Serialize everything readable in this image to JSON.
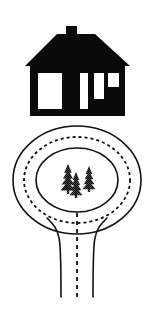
{
  "image": {
    "title": "House and roundabout diagram",
    "width": 153,
    "height": 318,
    "background_color": "#ffffff",
    "ink_color": "#000000",
    "style": "black-and-white line art clip-art"
  },
  "house": {
    "name": "house",
    "description": "Black silhouette of a single-storey house with hipped roof, chimney and white windows",
    "fill_color": "#0a0a0a",
    "opening_color": "#ffffff",
    "bounds": {
      "x": 25,
      "y": 26,
      "width": 105,
      "height": 90
    },
    "chimney": {
      "name": "chimney",
      "x": 66,
      "y": 26,
      "width": 11,
      "height": 12
    },
    "roof": {
      "name": "roof",
      "type": "hipped-trapezoid",
      "peak_left_x": 57,
      "peak_right_x": 95,
      "peak_y": 34,
      "eave_left_x": 25,
      "eave_right_x": 130,
      "eave_y": 66,
      "eave_stripe_color": "#ffffff"
    },
    "body": {
      "name": "house-body",
      "x": 30,
      "y": 66,
      "width": 95,
      "height": 50
    },
    "openings": [
      {
        "name": "window-large-left",
        "x": 38,
        "y": 73,
        "width": 24,
        "height": 36
      },
      {
        "name": "door",
        "x": 80,
        "y": 73,
        "width": 8,
        "height": 36
      },
      {
        "name": "window-middle-right",
        "x": 94,
        "y": 73,
        "width": 10,
        "height": 26
      },
      {
        "name": "window-small-right",
        "x": 108,
        "y": 73,
        "width": 11,
        "height": 14
      }
    ]
  },
  "roundabout": {
    "name": "roundabout",
    "center_x": 77,
    "center_y": 180,
    "outer_ring": {
      "name": "outer-kerb-line",
      "rx": 64,
      "ry": 54,
      "stroke": "#111111",
      "stroke_width": 1.6,
      "dash": "solid"
    },
    "lane_divider": {
      "name": "dashed-lane-marking",
      "rx": 53,
      "ry": 43,
      "stroke": "#111111",
      "stroke_width": 1.8,
      "dash": "3 3"
    },
    "inner_ring": {
      "name": "central-island-kerb",
      "rx": 41,
      "ry": 32,
      "stroke": "#111111",
      "stroke_width": 1.6,
      "dash": "solid"
    }
  },
  "trees": {
    "name": "tree-cluster",
    "count": 3,
    "description": "Three halftone-shaded conifer trees on the central island",
    "items": [
      {
        "name": "tree-left",
        "cx": 68,
        "base_y": 194,
        "height": 30,
        "width": 15
      },
      {
        "name": "tree-middle",
        "cx": 76,
        "base_y": 198,
        "height": 26,
        "width": 13
      },
      {
        "name": "tree-right",
        "cx": 89,
        "base_y": 192,
        "height": 26,
        "width": 13
      }
    ]
  },
  "road": {
    "name": "approach-road",
    "left_edge": {
      "name": "road-edge-left",
      "flare_start_x": 47,
      "flare_start_y": 218,
      "straight_x": 61,
      "bottom_y": 297,
      "stroke": "#111111",
      "stroke_width": 1.6
    },
    "right_edge": {
      "name": "road-edge-right",
      "flare_start_x": 107,
      "flare_start_y": 218,
      "straight_x": 93,
      "bottom_y": 297,
      "stroke": "#111111",
      "stroke_width": 1.6
    },
    "center_line": {
      "name": "road-centre-dashed-line",
      "x": 77,
      "top_y": 213,
      "bottom_y": 297,
      "stroke": "#111111",
      "stroke_width": 1.8,
      "dash": "4 4"
    }
  }
}
